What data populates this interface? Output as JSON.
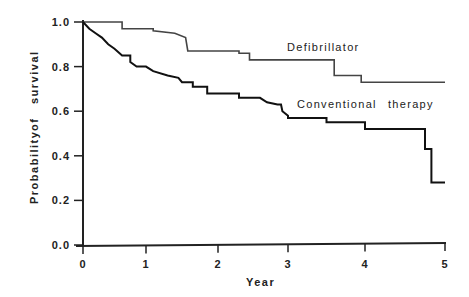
{
  "chart_data": {
    "type": "line",
    "subtype": "kaplan-meier step",
    "title": "",
    "xlabel": "Year",
    "ylabel": "Probability of survival",
    "xlim": [
      0,
      5
    ],
    "ylim": [
      0,
      1.0
    ],
    "xticks": [
      "0",
      "1",
      "2",
      "3",
      "4",
      "5"
    ],
    "yticks": [
      "0.0",
      "0.2",
      "0.4",
      "0.6",
      "0.8",
      "1.0"
    ],
    "grid": false,
    "legend": "inline labels",
    "series": [
      {
        "name": "Defibrillator",
        "style": "thin",
        "points": [
          [
            0,
            1.0
          ],
          [
            0.62,
            1.0
          ],
          [
            0.62,
            0.97
          ],
          [
            1.1,
            0.97
          ],
          [
            1.1,
            0.96
          ],
          [
            1.4,
            0.95
          ],
          [
            1.55,
            0.93
          ],
          [
            1.58,
            0.87
          ],
          [
            2.3,
            0.87
          ],
          [
            2.3,
            0.86
          ],
          [
            2.45,
            0.86
          ],
          [
            2.45,
            0.83
          ],
          [
            3.6,
            0.83
          ],
          [
            3.6,
            0.76
          ],
          [
            3.95,
            0.76
          ],
          [
            3.95,
            0.73
          ],
          [
            5.0,
            0.73
          ]
        ]
      },
      {
        "name": "Conventional therapy",
        "style": "thick",
        "points": [
          [
            0,
            1.0
          ],
          [
            0.1,
            0.97
          ],
          [
            0.2,
            0.95
          ],
          [
            0.3,
            0.93
          ],
          [
            0.4,
            0.9
          ],
          [
            0.5,
            0.88
          ],
          [
            0.62,
            0.85
          ],
          [
            0.75,
            0.85
          ],
          [
            0.75,
            0.82
          ],
          [
            0.85,
            0.8
          ],
          [
            1.0,
            0.8
          ],
          [
            1.1,
            0.78
          ],
          [
            1.3,
            0.76
          ],
          [
            1.45,
            0.75
          ],
          [
            1.5,
            0.73
          ],
          [
            1.65,
            0.73
          ],
          [
            1.65,
            0.71
          ],
          [
            1.85,
            0.71
          ],
          [
            1.85,
            0.68
          ],
          [
            2.3,
            0.68
          ],
          [
            2.3,
            0.66
          ],
          [
            2.6,
            0.66
          ],
          [
            2.7,
            0.64
          ],
          [
            2.85,
            0.63
          ],
          [
            2.9,
            0.63
          ],
          [
            2.92,
            0.6
          ],
          [
            3.0,
            0.58
          ],
          [
            3.0,
            0.57
          ],
          [
            3.5,
            0.57
          ],
          [
            3.5,
            0.55
          ],
          [
            4.0,
            0.55
          ],
          [
            4.0,
            0.52
          ],
          [
            4.75,
            0.52
          ],
          [
            4.75,
            0.43
          ],
          [
            4.83,
            0.43
          ],
          [
            4.83,
            0.28
          ],
          [
            5.0,
            0.28
          ]
        ]
      }
    ],
    "annotations": [
      {
        "text": "Defibrillator",
        "x": 2.95,
        "y": 0.9
      },
      {
        "text": "Conventional therapy",
        "x": 3.0,
        "y": 0.67
      }
    ]
  },
  "labels": {
    "xlabel": "Year",
    "ylabel_parts": [
      "Probability",
      "of",
      "survival"
    ],
    "defib": "Defibrillator",
    "conv_a": "Conventional",
    "conv_b": "therapy"
  }
}
